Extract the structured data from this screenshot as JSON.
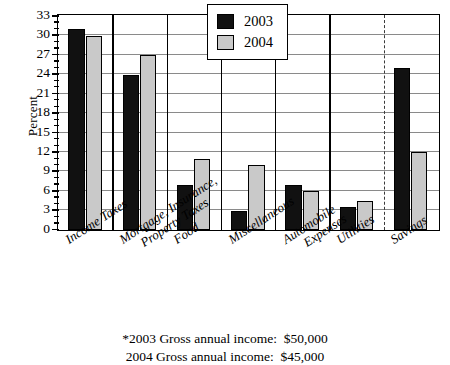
{
  "chart_data": {
    "type": "bar",
    "title": "",
    "xlabel": "",
    "ylabel": "Percent",
    "ylim": [
      0,
      33
    ],
    "ytick_step": 3,
    "yminor_step": 1,
    "grid": true,
    "legend_position": "top-right-inside",
    "categories": [
      "Income Taxes",
      "Mortgage, Insurance, Property Taxes",
      "Food",
      "Miscellaneous",
      "Automobile Expenses",
      "Utilities",
      "Savings"
    ],
    "ytick_labels": [
      "0",
      "3",
      "6",
      "9",
      "12",
      "15",
      "18",
      "21",
      "24",
      "27",
      "30",
      "33"
    ],
    "series": [
      {
        "name": "2003",
        "color": "#111111",
        "values": [
          31,
          24,
          7,
          3,
          7,
          3.5,
          25
        ]
      },
      {
        "name": "2004",
        "color": "#c9c9c9",
        "values": [
          30,
          27,
          11,
          10,
          6,
          4.5,
          12
        ]
      }
    ],
    "annotations": [
      "*2003 Gross annual income:  $50,000",
      "2004 Gross annual income:  $45,000"
    ],
    "separator_after_category_index": 5,
    "separator_style": "dashed"
  },
  "axis": {
    "ylabel": "Percent"
  },
  "legend": {
    "items": [
      {
        "label": "2003"
      },
      {
        "label": "2004"
      }
    ]
  },
  "categories_display": [
    {
      "line1": "Income Taxes",
      "line2": ""
    },
    {
      "line1": "Mortgage, Insurance,",
      "line2": "Property Taxes"
    },
    {
      "line1": "Food",
      "line2": ""
    },
    {
      "line1": "Miscellaneous",
      "line2": ""
    },
    {
      "line1": "Automobile",
      "line2": "Expenses"
    },
    {
      "line1": "Utilities",
      "line2": ""
    },
    {
      "line1": "Savings",
      "line2": ""
    }
  ],
  "footnotes": {
    "line1": "*2003 Gross annual income:  $50,000",
    "line2": "2004 Gross annual income:  $45,000"
  }
}
